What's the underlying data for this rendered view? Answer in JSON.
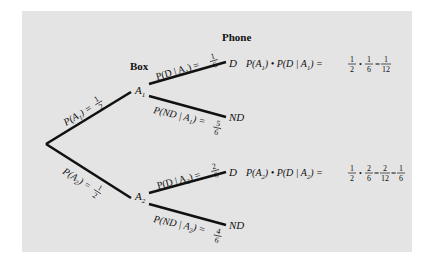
{
  "diagram": {
    "type": "probability-tree",
    "headers": {
      "box": "Box",
      "phone": "Phone"
    },
    "root": {
      "id": "start"
    },
    "level1": [
      {
        "node": "A",
        "subscript": "1",
        "edge_label": {
          "prefix": "P(A",
          "sub": "1",
          "suffix": ") =",
          "num": "1",
          "den": "2"
        },
        "children": [
          {
            "node": "D",
            "edge_label": {
              "prefix": "P(D | A",
              "sub": "1",
              "suffix": ") =",
              "num": "1",
              "den": "6"
            },
            "product": {
              "lhs_a": "P(A",
              "lhs_a_sub": "1",
              "lhs_b": ") • P(D | A",
              "lhs_b_sub": "1",
              "lhs_c": ") =",
              "f1_num": "1",
              "f1_den": "2",
              "dot": "•",
              "f2_num": "1",
              "f2_den": "6",
              "eq": "=",
              "r1_num": "1",
              "r1_den": "12"
            }
          },
          {
            "node": "ND",
            "edge_label": {
              "prefix": "P(ND | A",
              "sub": "1",
              "suffix": ") =",
              "num": "5",
              "den": "6"
            }
          }
        ]
      },
      {
        "node": "A",
        "subscript": "2",
        "edge_label": {
          "prefix": "P(A",
          "sub": "2",
          "suffix": ") =",
          "num": "1",
          "den": "2"
        },
        "children": [
          {
            "node": "D",
            "edge_label": {
              "prefix": "P(D | A",
              "sub": "2",
              "suffix": ") =",
              "num": "2",
              "den": "6"
            },
            "product": {
              "lhs_a": "P(A",
              "lhs_a_sub": "2",
              "lhs_b": ") • P(D | A",
              "lhs_b_sub": "2",
              "lhs_c": ") =",
              "f1_num": "1",
              "f1_den": "2",
              "dot": "•",
              "f2_num": "2",
              "f2_den": "6",
              "eq": "=",
              "r1_num": "2",
              "r1_den": "12",
              "eq2": "=",
              "r2_num": "1",
              "r2_den": "6"
            }
          },
          {
            "node": "ND",
            "edge_label": {
              "prefix": "P(ND | A",
              "sub": "2",
              "suffix": ") =",
              "num": "4",
              "den": "6"
            }
          }
        ]
      }
    ]
  },
  "colors": {
    "panel": "#e4e4e4",
    "ink": "#111111"
  }
}
